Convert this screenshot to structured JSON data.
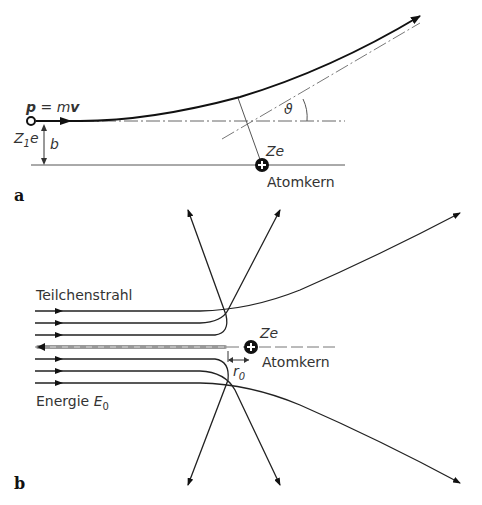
{
  "figure_a": {
    "part_label": "a",
    "momentum_label": "p = mv",
    "momentum_p": "p",
    "momentum_eq": " = m",
    "momentum_v": "v",
    "projectile_charge": "Z",
    "projectile_charge_sub": "1",
    "projectile_charge_e": "e",
    "impact_parameter": "b",
    "angle_label": "ϑ",
    "nucleus_charge": "Ze",
    "nucleus_label": "Atomkern"
  },
  "figure_b": {
    "part_label": "b",
    "beam_label": "Teilchenstrahl",
    "energy_label": "Energie",
    "energy_symbol": "E",
    "energy_sub": "0",
    "nucleus_charge": "Ze",
    "nucleus_label": "Atomkern",
    "distance_label": "r",
    "distance_sub": "0"
  }
}
